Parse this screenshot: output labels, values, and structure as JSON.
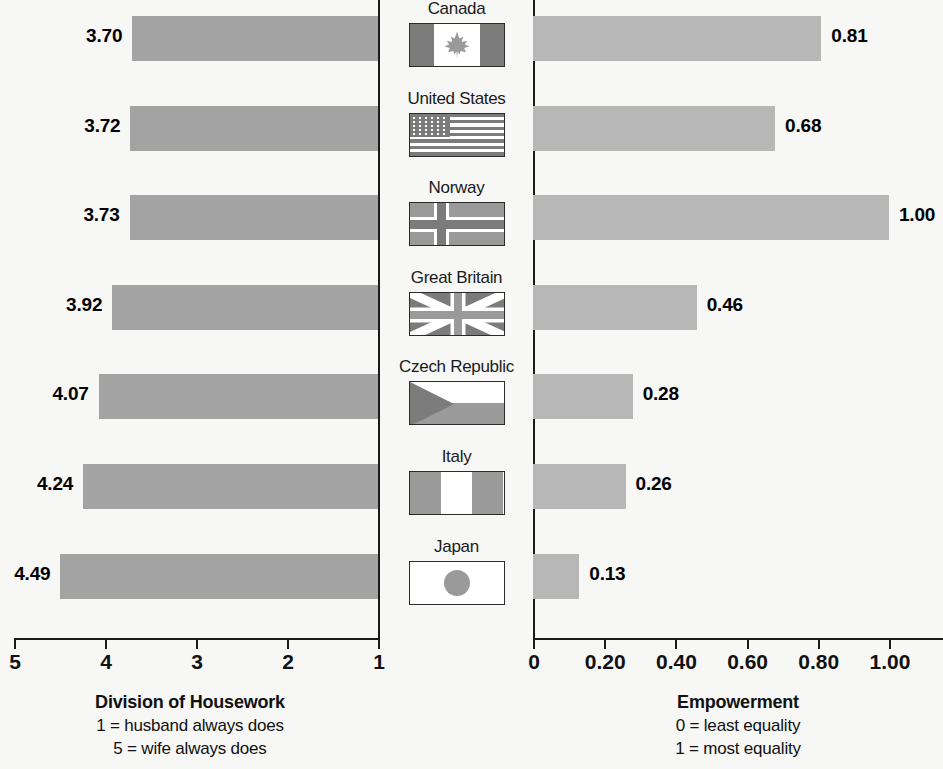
{
  "chart_data": {
    "type": "bar",
    "title": "",
    "orientation": "horizontal",
    "layout": "diverging-paired-panels",
    "categories": [
      "Canada",
      "United States",
      "Norway",
      "Great Britain",
      "Czech Republic",
      "Italy",
      "Japan"
    ],
    "panels": [
      {
        "id": "division-of-housework",
        "position": "left",
        "title": "Division of Housework",
        "sublabels": [
          "1 = husband always does",
          "5 = wife always does"
        ],
        "values": [
          3.7,
          3.72,
          3.73,
          3.92,
          4.07,
          4.24,
          4.49
        ],
        "value_labels": [
          "3.70",
          "3.72",
          "3.73",
          "3.92",
          "4.07",
          "4.24",
          "4.49"
        ],
        "tick_labels": [
          "5",
          "4",
          "3",
          "2",
          "1"
        ],
        "ticks": [
          5,
          4,
          3,
          2,
          1
        ],
        "xlim": [
          5,
          1
        ],
        "axis_direction": "reversed",
        "bar_color": "#a3a3a3",
        "grid": false
      },
      {
        "id": "empowerment",
        "position": "right",
        "title": "Empowerment",
        "sublabels": [
          "0 = least equality",
          "1 = most equality"
        ],
        "values": [
          0.81,
          0.68,
          1.0,
          0.46,
          0.28,
          0.26,
          0.13
        ],
        "value_labels": [
          "0.81",
          "0.68",
          "1.00",
          "0.46",
          "0.28",
          "0.26",
          "0.13"
        ],
        "tick_labels": [
          "0",
          "0.20",
          "0.40",
          "0.60",
          "0.80",
          "1.00"
        ],
        "ticks": [
          0,
          0.2,
          0.4,
          0.6,
          0.8,
          1.0
        ],
        "xlim": [
          0,
          1.0
        ],
        "axis_direction": "normal",
        "bar_color": "#b7b7b7",
        "grid": false
      }
    ],
    "legend": null,
    "ylabel": "",
    "xlabel": ""
  },
  "rows": [
    {
      "country": "Canada",
      "flag": "flag-canada",
      "housework": "3.70",
      "empowerment": "0.81"
    },
    {
      "country": "United States",
      "flag": "flag-united-states",
      "housework": "3.72",
      "empowerment": "0.68"
    },
    {
      "country": "Norway",
      "flag": "flag-norway",
      "housework": "3.73",
      "empowerment": "1.00"
    },
    {
      "country": "Great Britain",
      "flag": "flag-great-britain",
      "housework": "3.92",
      "empowerment": "0.46"
    },
    {
      "country": "Czech Republic",
      "flag": "flag-czech-republic",
      "housework": "4.07",
      "empowerment": "0.28"
    },
    {
      "country": "Italy",
      "flag": "flag-italy",
      "housework": "4.24",
      "empowerment": "0.26"
    },
    {
      "country": "Japan",
      "flag": "flag-japan",
      "housework": "4.49",
      "empowerment": "0.13"
    }
  ],
  "left_axis": {
    "ticks": [
      {
        "label": "5"
      },
      {
        "label": "4"
      },
      {
        "label": "3"
      },
      {
        "label": "2"
      },
      {
        "label": "1"
      }
    ],
    "caption_title": "Division of Housework",
    "caption_lines": [
      "1 = husband always does",
      "5 = wife always does"
    ]
  },
  "right_axis": {
    "ticks": [
      {
        "label": "0"
      },
      {
        "label": "0.20"
      },
      {
        "label": "0.40"
      },
      {
        "label": "0.60"
      },
      {
        "label": "0.80"
      },
      {
        "label": "1.00"
      }
    ],
    "caption_title": "Empowerment",
    "caption_lines": [
      "0 = least equality",
      "1 = most equality"
    ]
  },
  "colors": {
    "background": "#f7f7f5",
    "bar_left": "#a3a3a3",
    "bar_right": "#b7b7b7",
    "axis": "#1a1a1a",
    "text": "#111111",
    "flag_dark": "#7b7b7b",
    "flag_mid": "#9a9a9a",
    "flag_light": "#ffffff"
  }
}
